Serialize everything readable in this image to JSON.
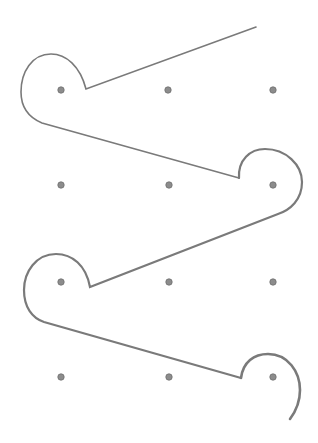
{
  "diagram": {
    "type": "dot-grid-path",
    "canvas": {
      "width": 318,
      "height": 443,
      "background": "#ffffff"
    },
    "colors": {
      "stroke": "#7a7a7a",
      "dot_fill": "#8c8c8c",
      "dot_stroke": "#6e6e6e"
    },
    "grid": {
      "rows": 4,
      "cols": 3,
      "dots": [
        {
          "row": 1,
          "col": 1,
          "x": 61,
          "y": 90
        },
        {
          "row": 1,
          "col": 2,
          "x": 168,
          "y": 90
        },
        {
          "row": 1,
          "col": 3,
          "x": 273,
          "y": 90
        },
        {
          "row": 2,
          "col": 1,
          "x": 61,
          "y": 185
        },
        {
          "row": 2,
          "col": 2,
          "x": 169,
          "y": 185
        },
        {
          "row": 2,
          "col": 3,
          "x": 273,
          "y": 185
        },
        {
          "row": 3,
          "col": 1,
          "x": 61,
          "y": 282
        },
        {
          "row": 3,
          "col": 2,
          "x": 169,
          "y": 282
        },
        {
          "row": 3,
          "col": 3,
          "x": 273,
          "y": 282
        },
        {
          "row": 4,
          "col": 1,
          "x": 61,
          "y": 377
        },
        {
          "row": 4,
          "col": 2,
          "x": 169,
          "y": 377
        },
        {
          "row": 4,
          "col": 3,
          "x": 273,
          "y": 377
        }
      ]
    },
    "segments": [
      {
        "name": "path-segment-1",
        "d": "M256,27 L86,89 C80,66 66,54 51,54 C32,54 21,72 21,92 C21,108 30,118 42,123 L239,178",
        "width": 1.6
      },
      {
        "name": "path-segment-2",
        "d": "M239,178 C238,160 250,149 265,149 C286,149 302,165 302,182 C302,200 290,210 278,214 L90,287 C86,265 72,254 56,254 C36,254 24,272 24,290 C24,307 32,318 44,322 L241,378",
        "width": 2.2
      },
      {
        "name": "path-segment-3",
        "d": "M241,378 C243,362 254,354 268,354 C288,354 300,372 300,390 C300,402 296,411 290,419",
        "width": 2.6
      }
    ]
  }
}
